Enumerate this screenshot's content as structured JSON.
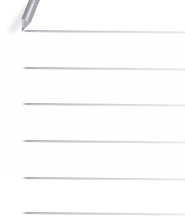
{
  "document": {
    "kind": "lined-notepaper-scan",
    "title": "Blank ruled note sheet with pencil",
    "background_color": "#ffffff",
    "width": 185,
    "height": 218
  },
  "paper": {
    "line_color": "#a8aab0",
    "line_color_light": "#d8dae0",
    "line_count": 6,
    "note_text": "",
    "lines": [
      {
        "id": "rule-1",
        "index": 1,
        "left": 22,
        "top": 30,
        "width": 163,
        "tilt_deg": 0.55,
        "content": ""
      },
      {
        "id": "rule-2",
        "index": 2,
        "left": 22,
        "top": 67,
        "width": 163,
        "tilt_deg": 0.55,
        "content": ""
      },
      {
        "id": "rule-3",
        "index": 3,
        "left": 22,
        "top": 103,
        "width": 163,
        "tilt_deg": 0.55,
        "content": ""
      },
      {
        "id": "rule-4",
        "index": 4,
        "left": 22,
        "top": 140,
        "width": 163,
        "tilt_deg": 0.55,
        "content": ""
      },
      {
        "id": "rule-5",
        "index": 5,
        "left": 22,
        "top": 177,
        "width": 163,
        "tilt_deg": 0.55,
        "content": ""
      },
      {
        "id": "rule-6",
        "index": 6,
        "left": 22,
        "top": 212,
        "width": 163,
        "tilt_deg": 0.55,
        "content": ""
      }
    ]
  },
  "pencil": {
    "icon_name": "pencil-icon",
    "label": "Pencil",
    "body_color": "#9a9ba0",
    "body_highlight": "#d7d8dc",
    "tip_color": "#74767c",
    "shadow_color": "#cdced3",
    "angle_deg": 22,
    "position": {
      "x": 12,
      "y": -4,
      "width": 32,
      "height": 40
    }
  }
}
